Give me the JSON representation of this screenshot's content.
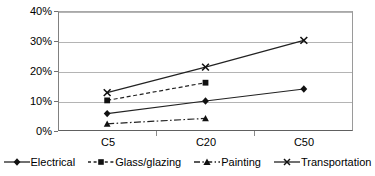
{
  "chart_data": {
    "type": "line",
    "title": "",
    "xlabel": "",
    "ylabel": "",
    "categories": [
      "C5",
      "C20",
      "C50"
    ],
    "ylim": [
      0,
      40
    ],
    "ytick_labels": [
      "0%",
      "10%",
      "20%",
      "30%",
      "40%"
    ],
    "ytick_values": [
      0,
      10,
      20,
      30,
      40
    ],
    "grid": true,
    "legend_position": "bottom",
    "value_suffix": "%",
    "series": [
      {
        "name": "Electrical",
        "marker": "diamond",
        "line_style": "solid",
        "values": [
          5.8,
          10.0,
          14.0
        ]
      },
      {
        "name": "Glass/glazing",
        "marker": "square",
        "line_style": "dashed",
        "values": [
          10.2,
          16.1,
          null
        ]
      },
      {
        "name": "Painting",
        "marker": "triangle",
        "line_style": "dash-dot",
        "values": [
          2.4,
          4.2,
          null
        ]
      },
      {
        "name": "Transportation",
        "marker": "x",
        "line_style": "solid",
        "values": [
          12.8,
          21.3,
          30.2
        ]
      }
    ]
  },
  "axis": {
    "y": {
      "t0": "0%",
      "t1": "10%",
      "t2": "20%",
      "t3": "30%",
      "t4": "40%"
    },
    "x": {
      "c0": "C5",
      "c1": "C20",
      "c2": "C50"
    }
  },
  "legend": {
    "items": [
      {
        "label": "Electrical"
      },
      {
        "label": "Glass/glazing"
      },
      {
        "label": "Painting"
      },
      {
        "label": "Transportation"
      }
    ]
  },
  "colors": {
    "series_line": "#222222",
    "gridline": "#b4b4b4",
    "axis": "#707070",
    "text": "#000000",
    "background": "#ffffff"
  }
}
